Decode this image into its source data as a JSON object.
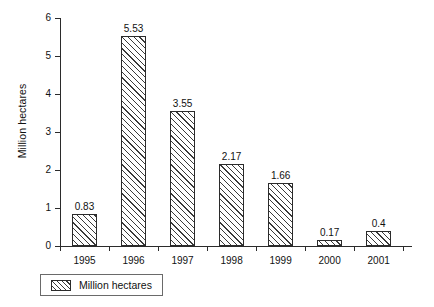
{
  "chart_data": {
    "type": "bar",
    "title": "",
    "subtitle": "",
    "xlabel": "",
    "ylabel": "Million hectares",
    "categories": [
      "1995",
      "1996",
      "1997",
      "1998",
      "1999",
      "2000",
      "2001"
    ],
    "values": [
      0.83,
      5.53,
      3.55,
      2.17,
      1.66,
      0.17,
      0.4
    ],
    "value_labels": [
      "0.83",
      "5.53",
      "3.55",
      "2.17",
      "1.66",
      "0.17",
      "0.4"
    ],
    "series": [
      {
        "name": "Million hectares",
        "values": [
          0.83,
          5.53,
          3.55,
          2.17,
          1.66,
          0.17,
          0.4
        ]
      }
    ],
    "ylim": [
      0,
      6
    ],
    "y_ticks": [
      0,
      1,
      2,
      3,
      4,
      5,
      6
    ],
    "y_tick_labels": [
      "0",
      "1",
      "2",
      "3",
      "4",
      "5",
      "6"
    ],
    "grid": false,
    "legend_position": "bottom-left",
    "legend_entries": [
      {
        "label": "Million hectares",
        "swatch": "diagonal-hatch"
      }
    ],
    "colors": {
      "bar_fill": "#ffffff",
      "bar_hatch": "#3a3a3a",
      "bar_outline": "#2b2b2b",
      "axis": "#2b2b2b",
      "text": "#111111",
      "background": "#ffffff",
      "legend_border": "#6a6a6a"
    }
  },
  "legend": {
    "label": "Million hectares"
  },
  "axes": {
    "y_title": "Million hectares"
  }
}
